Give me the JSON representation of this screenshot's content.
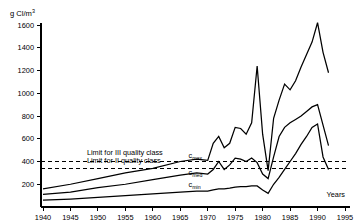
{
  "chart_data": {
    "type": "line",
    "title": "",
    "ylabel": "g Cl/m",
    "ylabel_sup": "3",
    "xlabel": "Years",
    "xlim": [
      1940,
      1995
    ],
    "ylim": [
      0,
      1700
    ],
    "yticks": [
      200,
      400,
      600,
      800,
      1000,
      1200,
      1400,
      1600
    ],
    "ytick_labels": [
      "200",
      "400",
      "600",
      "800",
      "1000",
      "1200",
      "1400",
      "1600"
    ],
    "xticks": [
      1940,
      1945,
      1950,
      1955,
      1960,
      1965,
      1970,
      1975,
      1980,
      1985,
      1990,
      1995
    ],
    "xtick_labels": [
      "1940",
      "1945",
      "1950",
      "1955",
      "1960",
      "1965",
      "1970",
      "1975",
      "1980",
      "1985",
      "1990",
      "1995"
    ],
    "grid": false,
    "legend_position": "inline-annotations",
    "series": [
      {
        "name": "c_max",
        "label": "c",
        "label_sub": "max",
        "label_x": 1966.5,
        "label_y": 430,
        "x": [
          1940,
          1945,
          1950,
          1955,
          1960,
          1965,
          1968,
          1970,
          1971,
          1972,
          1973,
          1974,
          1975,
          1976,
          1977,
          1978,
          1979,
          1980,
          1981,
          1982,
          1983,
          1984,
          1985,
          1986,
          1987,
          1988,
          1989,
          1990,
          1991,
          1992
        ],
        "values": [
          160,
          200,
          250,
          300,
          340,
          400,
          420,
          410,
          560,
          620,
          520,
          560,
          700,
          690,
          640,
          740,
          1240,
          640,
          320,
          780,
          940,
          1080,
          1030,
          1110,
          1230,
          1340,
          1450,
          1620,
          1360,
          1180
        ]
      },
      {
        "name": "c_med",
        "label": "c",
        "label_sub": "med",
        "label_x": 1966.5,
        "label_y": 280,
        "x": [
          1940,
          1945,
          1950,
          1955,
          1960,
          1965,
          1968,
          1970,
          1971,
          1972,
          1973,
          1974,
          1975,
          1976,
          1977,
          1978,
          1979,
          1980,
          1981,
          1982,
          1983,
          1984,
          1985,
          1986,
          1987,
          1988,
          1989,
          1990,
          1991,
          1992
        ],
        "values": [
          110,
          130,
          170,
          200,
          240,
          280,
          300,
          290,
          330,
          400,
          330,
          370,
          430,
          420,
          400,
          430,
          390,
          290,
          250,
          440,
          620,
          700,
          740,
          770,
          800,
          840,
          880,
          900,
          720,
          540
        ]
      },
      {
        "name": "c_min",
        "label": "c",
        "label_sub": "min",
        "label_x": 1966.5,
        "label_y": 175,
        "x": [
          1940,
          1945,
          1950,
          1955,
          1960,
          1965,
          1968,
          1970,
          1971,
          1972,
          1973,
          1974,
          1975,
          1976,
          1977,
          1978,
          1979,
          1980,
          1981,
          1982,
          1983,
          1984,
          1985,
          1986,
          1987,
          1988,
          1989,
          1990,
          1991,
          1992
        ],
        "values": [
          60,
          70,
          85,
          100,
          115,
          130,
          140,
          140,
          150,
          160,
          160,
          165,
          175,
          180,
          180,
          185,
          185,
          150,
          120,
          200,
          260,
          330,
          400,
          470,
          550,
          620,
          700,
          730,
          440,
          330
        ]
      }
    ],
    "limits": [
      {
        "name": "limit-iii-quality-class",
        "label": "Limit for III quality class",
        "value": 400,
        "label_x": 1948,
        "label_y": 455
      },
      {
        "name": "limit-ii-quality-class",
        "label": "Limit for II quality class",
        "value": 340,
        "label_x": 1948,
        "label_y": 390
      }
    ]
  }
}
